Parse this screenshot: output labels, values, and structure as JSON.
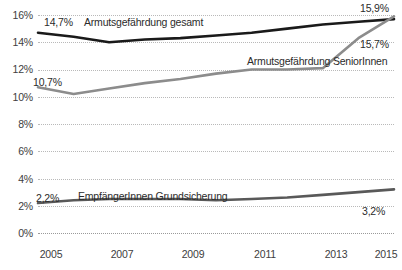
{
  "chart_data": {
    "type": "line",
    "title": "",
    "xlabel": "",
    "ylabel": "",
    "x": [
      2005,
      2006,
      2007,
      2008,
      2009,
      2010,
      2011,
      2012,
      2013,
      2014,
      2015
    ],
    "xtick_labels": [
      "2005",
      "2007",
      "2009",
      "2011",
      "2013",
      "2015"
    ],
    "xtick_values": [
      2005,
      2007,
      2009,
      2011,
      2013,
      2015
    ],
    "ytick_labels": [
      "0%",
      "2%",
      "4%",
      "6%",
      "8%",
      "10%",
      "12%",
      "14%",
      "16%"
    ],
    "ytick_values": [
      0,
      2,
      4,
      6,
      8,
      10,
      12,
      14,
      16
    ],
    "ylim": [
      0,
      16
    ],
    "xlim": [
      2005,
      2015
    ],
    "grid": "horizontal-dotted",
    "legend": "inline-labels",
    "series": [
      {
        "name": "Armutsgefährdung gesamt",
        "color": "#1a1a1a",
        "values": [
          14.7,
          14.4,
          14.0,
          14.2,
          14.3,
          14.5,
          14.7,
          15.0,
          15.3,
          15.5,
          15.7
        ],
        "start_label": "14,7%",
        "end_label": "15,7%"
      },
      {
        "name": "Armutsgefährdung SeniorInnen",
        "color": "#8c8c8c",
        "values": [
          10.7,
          10.2,
          10.6,
          11.0,
          11.3,
          11.7,
          12.0,
          12.0,
          12.1,
          14.3,
          15.9
        ],
        "start_label": "10,7%",
        "end_label": "15,9%"
      },
      {
        "name": "EmpfängerInnen Grundsicherung",
        "color": "#595959",
        "values": [
          2.2,
          2.4,
          2.5,
          2.5,
          2.5,
          2.4,
          2.5,
          2.6,
          2.8,
          3.0,
          3.2
        ],
        "start_label": "2,2%",
        "end_label": "3,2%"
      }
    ]
  },
  "annotations": {
    "total_start": "14,7%",
    "total_end": "15,7%",
    "total_name": "Armutsgefährdung gesamt",
    "seniors_start": "10,7%",
    "seniors_end": "15,9%",
    "seniors_name": "Armutsgefährdung SeniorInnen",
    "basic_start": "2,2%",
    "basic_end": "3,2%",
    "basic_name": "EmpfängerInnen Grundsicherung"
  },
  "axis": {
    "y": [
      "16%",
      "14%",
      "12%",
      "10%",
      "8%",
      "6%",
      "4%",
      "2%",
      "0%"
    ],
    "x": [
      "2005",
      "2007",
      "2009",
      "2011",
      "2013",
      "2015"
    ]
  }
}
